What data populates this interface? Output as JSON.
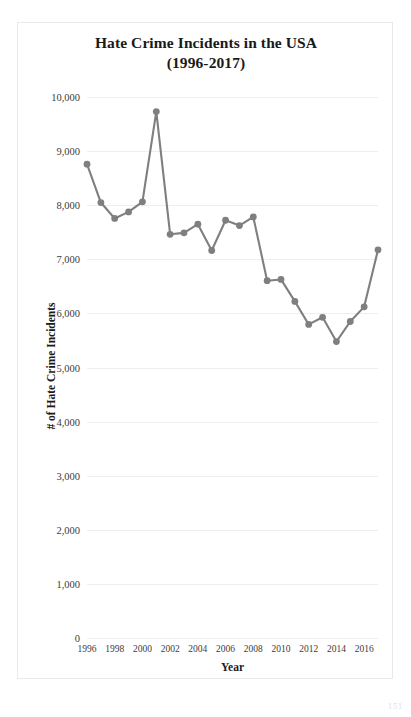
{
  "figure": {
    "title_line1": "Hate Crime Incidents in the USA",
    "title_line2": "(1996-2017)",
    "corner_mark": "151"
  },
  "chart_data": {
    "type": "line",
    "title": "Hate Crime Incidents in the USA (1996-2017)",
    "xlabel": "Year",
    "ylabel": "# of Hate Crime Incidents",
    "x": [
      1996,
      1997,
      1998,
      1999,
      2000,
      2001,
      2002,
      2003,
      2004,
      2005,
      2006,
      2007,
      2008,
      2009,
      2010,
      2011,
      2012,
      2013,
      2014,
      2015,
      2016,
      2017
    ],
    "values": [
      8759,
      8049,
      7755,
      7876,
      8063,
      9730,
      7462,
      7489,
      7649,
      7163,
      7722,
      7624,
      7783,
      6604,
      6628,
      6222,
      5796,
      5928,
      5479,
      5850,
      6121,
      7175
    ],
    "series": [
      {
        "name": "# of Hate Crime Incidents",
        "values": [
          8759,
          8049,
          7755,
          7876,
          8063,
          9730,
          7462,
          7489,
          7649,
          7163,
          7722,
          7624,
          7783,
          6604,
          6628,
          6222,
          5796,
          5928,
          5479,
          5850,
          6121,
          7175
        ]
      }
    ],
    "ylim": [
      0,
      10000
    ],
    "xlim": [
      1996,
      2017
    ],
    "ytick_values": [
      0,
      1000,
      2000,
      3000,
      4000,
      5000,
      6000,
      7000,
      8000,
      9000,
      10000
    ],
    "ytick_labels": [
      "0",
      "1,000",
      "2,000",
      "3,000",
      "4,000",
      "5,000",
      "6,000",
      "7,000",
      "8,000",
      "9,000",
      "10,000"
    ],
    "xtick_values": [
      1996,
      1998,
      2000,
      2002,
      2004,
      2006,
      2008,
      2010,
      2012,
      2014,
      2016
    ],
    "xtick_labels": [
      "1996",
      "1998",
      "2000",
      "2002",
      "2004",
      "2006",
      "2008",
      "2010",
      "2012",
      "2014",
      "2016"
    ],
    "grid": "horizontal",
    "legend": "none",
    "line_color": "#7f7f7f",
    "marker_color": "#7f7f7f",
    "grid_color": "#eeeeee"
  }
}
